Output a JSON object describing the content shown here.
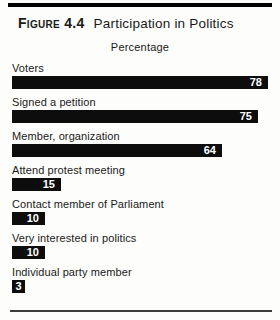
{
  "figure": {
    "label": "Figure 4.4",
    "title": "Participation in Politics",
    "axis_title": "Percentage"
  },
  "chart_data": {
    "type": "bar",
    "orientation": "horizontal",
    "title": "Participation in Politics",
    "xlabel": "Percentage",
    "categories": [
      "Voters",
      "Signed a petition",
      "Member, organization",
      "Attend protest meeting",
      "Contact member of Parliament",
      "Very interested in politics",
      "Individual party member"
    ],
    "values": [
      78,
      75,
      64,
      15,
      10,
      10,
      3
    ],
    "xlim": [
      0,
      80
    ],
    "value_labels_inside_bars": true,
    "legend": "none",
    "grid": false,
    "bar_color": "#0d0d0d",
    "value_label_color": "#ffffff"
  },
  "colors": {
    "background": "#fdfdfb",
    "text": "#1a1a1a",
    "top_rule": "#000000",
    "bottom_rule": "#3d3d3d"
  }
}
